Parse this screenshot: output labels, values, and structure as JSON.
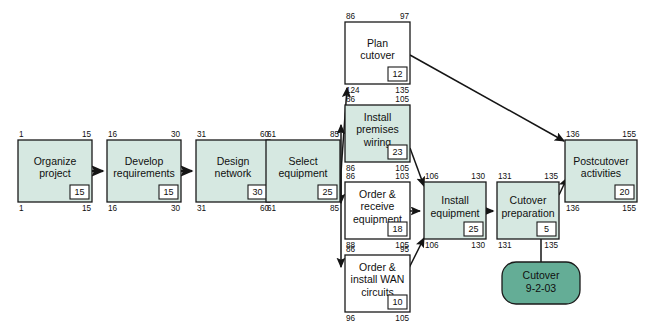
{
  "diagram": {
    "type": "pert-network-diagram",
    "legend_note": "Shaded (green) boxes are critical path activities; white boxes have slack",
    "colors": {
      "critical_fill": "#d6e8e1",
      "normal_fill": "#ffffff",
      "milestone_fill": "#64ad96",
      "line": "#151515",
      "text": "#101010"
    },
    "corner_meaning": {
      "top_left": "earliest start",
      "top_right": "earliest finish",
      "bottom_left": "latest start",
      "bottom_right": "latest finish",
      "inset": "duration"
    }
  },
  "nodes": [
    {
      "id": "organize-project",
      "label_lines": [
        "Organize",
        "project"
      ],
      "early_start": "1",
      "early_finish": "15",
      "late_start": "1",
      "late_finish": "15",
      "duration": "15",
      "critical": true,
      "x": 18,
      "y": 140,
      "w": 74,
      "h": 62
    },
    {
      "id": "develop-requirements",
      "label_lines": [
        "Develop",
        "requirements"
      ],
      "early_start": "16",
      "early_finish": "30",
      "late_start": "16",
      "late_finish": "30",
      "duration": "15",
      "critical": true,
      "x": 107,
      "y": 140,
      "w": 74,
      "h": 62
    },
    {
      "id": "design-network",
      "label_lines": [
        "Design",
        "network"
      ],
      "early_start": "31",
      "early_finish": "60",
      "late_start": "31",
      "late_finish": "60",
      "duration": "30",
      "critical": true,
      "x": 196,
      "y": 140,
      "w": 74,
      "h": 62
    },
    {
      "id": "select-equipment",
      "label_lines": [
        "Select",
        "equipment"
      ],
      "early_start": "61",
      "early_finish": "85",
      "late_start": "61",
      "late_finish": "85",
      "duration": "25",
      "critical": true,
      "x": 266,
      "y": 140,
      "w": 74,
      "h": 62
    },
    {
      "id": "plan-cutover",
      "label_lines": [
        "Plan",
        "cutover"
      ],
      "early_start": "86",
      "early_finish": "97",
      "late_start": "124",
      "late_finish": "135",
      "duration": "12",
      "critical": false,
      "x": 345,
      "y": 22,
      "w": 65,
      "h": 62
    },
    {
      "id": "install-premises-wiring",
      "label_lines": [
        "Install",
        "premises",
        "wiring"
      ],
      "early_start": "86",
      "early_finish": "105",
      "late_start": "86",
      "late_finish": "105",
      "duration": "23",
      "critical": true,
      "x": 345,
      "y": 105,
      "w": 65,
      "h": 57
    },
    {
      "id": "order-receive-equipment",
      "label_lines": [
        "Order &",
        "receive",
        "equipment"
      ],
      "early_start": "86",
      "early_finish": "103",
      "late_start": "88",
      "late_finish": "105",
      "duration": "18",
      "critical": false,
      "x": 345,
      "y": 182,
      "w": 65,
      "h": 57
    },
    {
      "id": "order-install-wan-circuits",
      "label_lines": [
        "Order &",
        "install WAN",
        "circuits"
      ],
      "early_start": "86",
      "early_finish": "95",
      "late_start": "96",
      "late_finish": "105",
      "duration": "10",
      "critical": false,
      "x": 345,
      "y": 255,
      "w": 65,
      "h": 57
    },
    {
      "id": "install-equipment",
      "label_lines": [
        "Install",
        "equipment"
      ],
      "early_start": "106",
      "early_finish": "130",
      "late_start": "106",
      "late_finish": "130",
      "duration": "25",
      "critical": true,
      "x": 424,
      "y": 182,
      "w": 62,
      "h": 57
    },
    {
      "id": "cutover-preparation",
      "label_lines": [
        "Cutover",
        "preparation"
      ],
      "early_start": "131",
      "early_finish": "135",
      "late_start": "131",
      "late_finish": "135",
      "duration": "5",
      "critical": true,
      "x": 497,
      "y": 182,
      "w": 62,
      "h": 57
    },
    {
      "id": "postcutover-activities",
      "label_lines": [
        "Postcutover",
        "activities"
      ],
      "early_start": "136",
      "early_finish": "155",
      "late_start": "136",
      "late_finish": "155",
      "duration": "20",
      "critical": true,
      "x": 565,
      "y": 140,
      "w": 72,
      "h": 62
    }
  ],
  "milestone": {
    "id": "cutover-milestone",
    "label_lines": [
      "Cutover",
      "9-2-03"
    ],
    "x": 502,
    "y": 262,
    "w": 78,
    "h": 42
  }
}
